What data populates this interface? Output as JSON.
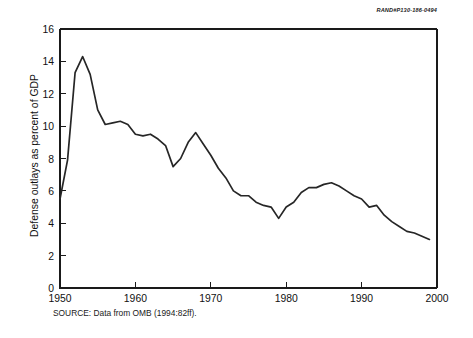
{
  "figure": {
    "doc_number": "RAND#P130-186-0494",
    "source_note": "SOURCE: Data from OMB (1994:82ff).",
    "line_color": "#262626",
    "axis_color": "#1a1a1a",
    "background_color": "#ffffff"
  },
  "chart_data": {
    "type": "line",
    "title": "",
    "subtitle": "",
    "xlabel": "",
    "ylabel": "Defense outlays as percent of GDP",
    "xlim": [
      1950,
      2000
    ],
    "ylim": [
      0,
      16
    ],
    "xticks": [
      1950,
      1960,
      1970,
      1980,
      1990,
      2000
    ],
    "xtick_labels": [
      "1950",
      "1960",
      "1970",
      "1980",
      "1990",
      "2000"
    ],
    "yticks": [
      0,
      2,
      4,
      6,
      8,
      10,
      12,
      14,
      16
    ],
    "ytick_labels": [
      "0",
      "2",
      "4",
      "6",
      "8",
      "10",
      "12",
      "14",
      "16"
    ],
    "grid": false,
    "legend": null,
    "legend_position": "none",
    "annotations": [
      "RAND#P130-186-0494",
      "SOURCE: Data from OMB (1994:82ff)."
    ],
    "series": [
      {
        "name": "Defense outlays as percent of GDP",
        "color": "#262626",
        "x": [
          1950,
          1951,
          1952,
          1953,
          1954,
          1955,
          1956,
          1957,
          1958,
          1959,
          1960,
          1961,
          1962,
          1963,
          1964,
          1965,
          1966,
          1967,
          1968,
          1969,
          1970,
          1971,
          1972,
          1973,
          1974,
          1975,
          1976,
          1977,
          1978,
          1979,
          1980,
          1981,
          1982,
          1983,
          1984,
          1985,
          1986,
          1987,
          1988,
          1989,
          1990,
          1991,
          1992,
          1993,
          1994,
          1995,
          1996,
          1997,
          1998,
          1999
        ],
        "values": [
          5.5,
          7.9,
          13.3,
          14.3,
          13.2,
          11.0,
          10.1,
          10.2,
          10.3,
          10.1,
          9.5,
          9.4,
          9.5,
          9.2,
          8.8,
          7.5,
          8.0,
          9.0,
          9.6,
          8.9,
          8.2,
          7.4,
          6.8,
          6.0,
          5.7,
          5.7,
          5.3,
          5.1,
          5.0,
          4.3,
          5.0,
          5.3,
          5.9,
          6.2,
          6.2,
          6.4,
          6.5,
          6.3,
          6.0,
          5.7,
          5.5,
          5.0,
          5.1,
          4.5,
          4.1,
          3.8,
          3.5,
          3.4,
          3.2,
          3.0
        ],
        "units": "percent of GDP"
      }
    ]
  }
}
